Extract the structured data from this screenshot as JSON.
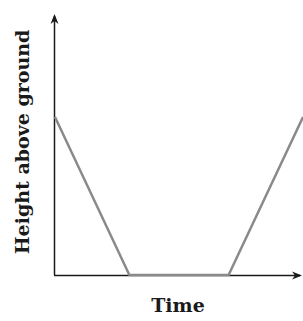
{
  "chart_data": {
    "type": "line",
    "title": "",
    "xlabel": "Time",
    "ylabel": "Height above ground",
    "grid": false,
    "legend": null,
    "axes": {
      "x_ticks": [],
      "y_ticks": [],
      "arrows": true
    },
    "series": [
      {
        "name": "height",
        "color": "#8a8a8a",
        "points": [
          {
            "x": 0,
            "y": 0.6
          },
          {
            "x": 0.3,
            "y": 0
          },
          {
            "x": 0.7,
            "y": 0
          },
          {
            "x": 1.0,
            "y": 0.6
          }
        ]
      }
    ],
    "xlim": [
      0,
      1
    ],
    "ylim": [
      0,
      1
    ]
  },
  "labels": {
    "x": "Time",
    "y": "Height above ground"
  },
  "colors": {
    "axis": "#1a1a1a",
    "line": "#8a8a8a"
  }
}
